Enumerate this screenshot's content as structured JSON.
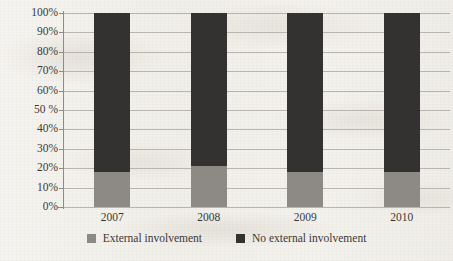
{
  "chart_data": {
    "type": "bar",
    "subtype": "stacked-100-percent",
    "title": "",
    "xlabel": "",
    "ylabel": "",
    "categories": [
      "2007",
      "2008",
      "2009",
      "2010"
    ],
    "series": [
      {
        "name": "External involvement",
        "color": "#8d8a85",
        "values": [
          18,
          21,
          18,
          18
        ]
      },
      {
        "name": "No external involvement",
        "color": "#333230",
        "values": [
          82,
          79,
          82,
          82
        ]
      }
    ],
    "ylim": [
      0,
      100
    ],
    "yticks": [
      0,
      10,
      20,
      30,
      40,
      50,
      60,
      70,
      80,
      90,
      100
    ],
    "ytick_labels": [
      "0%",
      "10%",
      "20%",
      "30%",
      "40%",
      "50 %",
      "60%",
      "70%",
      "80%",
      "90%",
      "100%"
    ],
    "grid": true,
    "grid_axis": "y",
    "legend_position": "bottom",
    "legend": [
      "External involvement",
      "No external involvement"
    ]
  },
  "axis": {
    "y_labels": [
      "100%",
      "90%",
      "80%",
      "70%",
      "60%",
      "50 %",
      "40%",
      "30%",
      "20%",
      "10%",
      "0%"
    ],
    "x_labels": [
      "2007",
      "2008",
      "2009",
      "2010"
    ]
  },
  "legend": {
    "items": [
      {
        "label": "External involvement",
        "swatch": "legend-swatch-gray",
        "color": "#8d8a85"
      },
      {
        "label": "No external involvement",
        "swatch": "legend-swatch-dark",
        "color": "#333230"
      }
    ]
  }
}
